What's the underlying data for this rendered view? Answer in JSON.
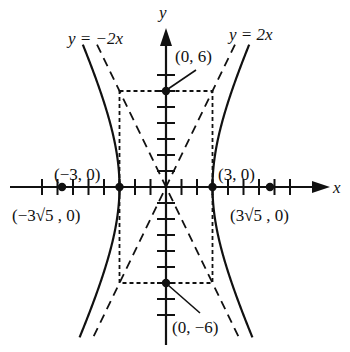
{
  "diagram": {
    "type": "hyperbola-graph",
    "equation_context": "vertical-axis hyperbola with center (0,0), transverse axis horizontal",
    "axes": {
      "x_label": "x",
      "y_label": "y",
      "x_range": [
        -9.5,
        10.5
      ],
      "y_range": [
        -10,
        9.5
      ],
      "x_tick_step": 1,
      "y_tick_step": 1
    },
    "colors": {
      "ink": "#111111",
      "background": "#ffffff"
    },
    "asymptotes": [
      {
        "label": "y = −2x",
        "slope": -2
      },
      {
        "label": "y = 2x",
        "slope": 2
      }
    ],
    "hyperbola": {
      "a": 3,
      "b": 6
    },
    "points": [
      {
        "name": "vertex-left",
        "x": -3,
        "y": 0,
        "label": "(−3, 0)"
      },
      {
        "name": "vertex-right",
        "x": 3,
        "y": 0,
        "label": "(3, 0)"
      },
      {
        "name": "co-vertex-top",
        "x": 0,
        "y": 6,
        "label": "(0, 6)"
      },
      {
        "name": "co-vertex-bottom",
        "x": 0,
        "y": -6,
        "label": "(0, −6)"
      },
      {
        "name": "focus-left",
        "x": -6.708,
        "y": 0,
        "label": "(−3√5 , 0)"
      },
      {
        "name": "focus-right",
        "x": 6.708,
        "y": 0,
        "label": "(3√5 , 0)"
      }
    ],
    "central_rectangle": {
      "x": [
        -3,
        3
      ],
      "y": [
        -6,
        6
      ]
    }
  }
}
